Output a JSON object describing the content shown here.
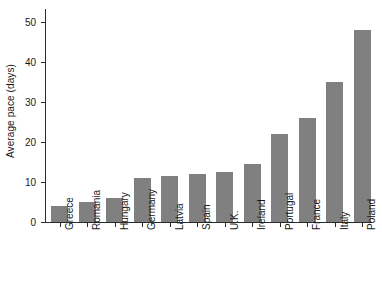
{
  "chart_data": {
    "type": "bar",
    "title": "",
    "subtitle": "",
    "xlabel": "",
    "ylabel": "Average pace (days)",
    "categories": [
      "Greece",
      "Romania",
      "Hungary",
      "Germany",
      "Latvia",
      "Spain",
      "U.K.",
      "Ireland",
      "Portugal",
      "France",
      "Italy",
      "Poland"
    ],
    "values": [
      4,
      5,
      6,
      11,
      11.5,
      12,
      12.5,
      14.5,
      22,
      26,
      35,
      48
    ],
    "ylim": [
      0,
      53
    ],
    "yticks": [
      0,
      10,
      20,
      30,
      40,
      50
    ],
    "ytick_labels": [
      "0",
      "10",
      "20",
      "30",
      "40",
      "50"
    ],
    "grid": false,
    "legend": null,
    "bar_color": "#808080",
    "axis_color": "#2b2b2b",
    "background": "#ffffff",
    "xtick_label_rotation": 90
  }
}
